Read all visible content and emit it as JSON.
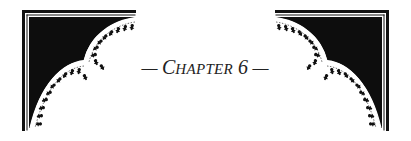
{
  "heading": {
    "dash_left": "— ",
    "first_letter": "C",
    "rest": "HAPTER",
    "number": " 6",
    "dash_right": " —"
  },
  "colors": {
    "ink": "#111111",
    "paper": "#ffffff"
  },
  "ornaments": {
    "left": "corner-ornament-top-left",
    "right": "corner-ornament-top-right"
  }
}
